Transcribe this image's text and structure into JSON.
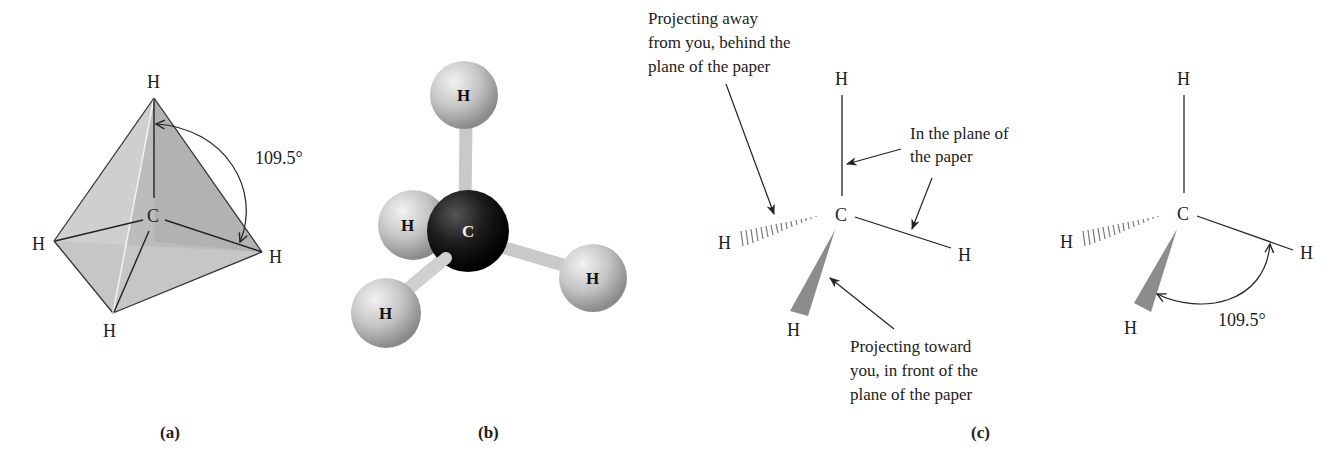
{
  "panels": {
    "a": {
      "caption": "(a)",
      "title": "Tetrahedral geometry",
      "center_atom": "C",
      "atoms": [
        "H",
        "H",
        "H",
        "H"
      ],
      "angle_label": "109.5°"
    },
    "b": {
      "caption": "(b)",
      "title": "Ball-and-stick model",
      "center_atom": "C",
      "atoms": [
        "H",
        "H",
        "H",
        "H"
      ]
    },
    "c": {
      "caption": "(c)",
      "left": {
        "center_atom": "C",
        "atoms": [
          "H",
          "H",
          "H",
          "H"
        ],
        "annotations": {
          "away_line1": "Projecting away",
          "away_line2": "from you, behind the",
          "away_line3": "plane of the paper",
          "plane_line1": "In the plane of",
          "plane_line2": "the paper",
          "toward_line1": "Projecting toward",
          "toward_line2": "you, in front of the",
          "toward_line3": "plane of the paper"
        }
      },
      "right": {
        "center_atom": "C",
        "atoms": [
          "H",
          "H",
          "H",
          "H"
        ],
        "angle_label": "109.5°"
      }
    }
  },
  "colors": {
    "face_light": "#d9d9d9",
    "face_mid": "#bdbdbd",
    "face_dark": "#9e9e9e",
    "carbon": "#1a1a1a",
    "hydrogen": "#c8c8c8",
    "wedge": "#8c8c8c"
  }
}
